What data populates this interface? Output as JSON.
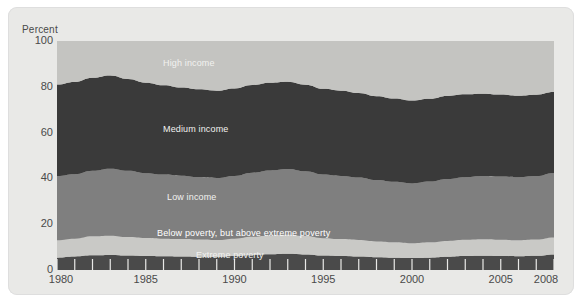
{
  "figure": {
    "background": "#ffffff",
    "card_background": "#e9e9e7",
    "plot_background": "#cfcfcc"
  },
  "chart_data": {
    "type": "area",
    "stacked": true,
    "title": "",
    "subtitle": "",
    "xlabel": "",
    "ylabel": "Percent",
    "ylim": [
      0,
      100
    ],
    "xlim": [
      1980,
      2008
    ],
    "grid": false,
    "legend_position": "inline-on-bands",
    "ytick_labels": [
      "100",
      "80",
      "60",
      "40",
      "20",
      "0"
    ],
    "ytick_values": [
      100,
      80,
      60,
      40,
      20,
      0
    ],
    "xtick_labels": [
      "1980",
      "1985",
      "1990",
      "1995",
      "2000",
      "2005",
      "2008"
    ],
    "xtick_values": [
      1980,
      1985,
      1990,
      1995,
      2000,
      2005,
      2008
    ],
    "x": [
      1980,
      1981,
      1982,
      1983,
      1984,
      1985,
      1986,
      1987,
      1988,
      1989,
      1990,
      1991,
      1992,
      1993,
      1994,
      1995,
      1996,
      1997,
      1998,
      1999,
      2000,
      2001,
      2002,
      2003,
      2004,
      2005,
      2006,
      2007,
      2008
    ],
    "series": [
      {
        "name": "Extreme poverty",
        "color": "#4a4a4a",
        "label_color": "#e8e8e6",
        "values": [
          5.4,
          5.9,
          6.4,
          6.6,
          6.3,
          6.1,
          6.0,
          5.9,
          5.8,
          5.7,
          6.1,
          6.6,
          6.9,
          7.1,
          6.8,
          6.3,
          6.1,
          5.9,
          5.6,
          5.4,
          5.2,
          5.4,
          5.8,
          6.1,
          6.2,
          6.1,
          6.0,
          6.2,
          6.8
        ]
      },
      {
        "name": "Below poverty, but above extreme poverty",
        "color": "#c9c9c6",
        "label_color": "#ffffff",
        "values": [
          7.6,
          7.8,
          8.3,
          8.4,
          8.1,
          7.9,
          7.7,
          7.6,
          7.5,
          7.4,
          7.6,
          7.9,
          8.2,
          8.3,
          8.0,
          7.6,
          7.4,
          7.2,
          6.9,
          6.7,
          6.5,
          6.7,
          6.9,
          7.1,
          7.2,
          7.1,
          7.0,
          7.1,
          7.4
        ]
      },
      {
        "name": "Low income",
        "color": "#7f7f7f",
        "label_color": "#f0f0ee",
        "values": [
          28.0,
          28.1,
          28.6,
          29.2,
          28.9,
          28.3,
          28.0,
          27.7,
          27.3,
          27.1,
          27.4,
          28.0,
          28.4,
          28.7,
          28.3,
          27.8,
          27.6,
          27.3,
          26.8,
          26.4,
          26.1,
          26.5,
          27.0,
          27.3,
          27.6,
          27.6,
          27.5,
          27.7,
          28.2
        ]
      },
      {
        "name": "Medium income",
        "color": "#3a3a3a",
        "label_color": "#ececea",
        "values": [
          40.0,
          40.3,
          40.6,
          40.7,
          40.1,
          39.5,
          39.0,
          38.5,
          38.3,
          38.1,
          38.2,
          38.3,
          38.3,
          38.1,
          37.8,
          37.4,
          37.2,
          36.9,
          36.6,
          36.4,
          36.2,
          36.2,
          36.3,
          36.2,
          36.0,
          35.8,
          35.6,
          35.5,
          35.3
        ]
      },
      {
        "name": "High income",
        "color": "#c4c4c1",
        "label_color": "#f4f4f2",
        "values": [
          19.0,
          17.9,
          16.1,
          15.1,
          16.6,
          18.2,
          19.3,
          20.3,
          21.1,
          21.7,
          20.7,
          19.2,
          18.2,
          17.8,
          19.1,
          20.9,
          21.7,
          22.7,
          24.1,
          25.1,
          26.0,
          25.2,
          24.0,
          23.3,
          23.0,
          23.4,
          23.9,
          23.5,
          22.3
        ]
      }
    ]
  },
  "labels": {
    "axis_title": "Percent",
    "high_income": "High income",
    "medium_income": "Medium income",
    "low_income": "Low income",
    "below_poverty": "Below poverty, but above extreme poverty",
    "extreme_poverty": "Extreme poverty"
  }
}
